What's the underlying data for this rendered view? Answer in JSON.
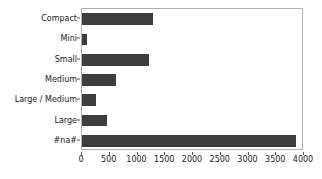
{
  "chart_data": {
    "type": "bar",
    "orientation": "horizontal",
    "title": "",
    "xlabel": "",
    "ylabel": "",
    "categories": [
      "Compact",
      "Mini",
      "Small",
      "Medium",
      "Large / Medium",
      "Large",
      "#na#"
    ],
    "values": [
      1288,
      90,
      1207,
      613,
      252,
      450,
      3856
    ],
    "xlim": [
      0,
      4000
    ],
    "xticks": [
      0,
      500,
      1000,
      1500,
      2000,
      2500,
      3000,
      3500,
      4000
    ],
    "xtick_labels": [
      "0",
      "500",
      "1000",
      "1500",
      "2000",
      "2500",
      "3000",
      "3500",
      "4000"
    ],
    "grid": false,
    "legend": null,
    "bar_color": "#3d3d3d",
    "frame_color": "#b0b0b0",
    "background": "#ffffff"
  }
}
